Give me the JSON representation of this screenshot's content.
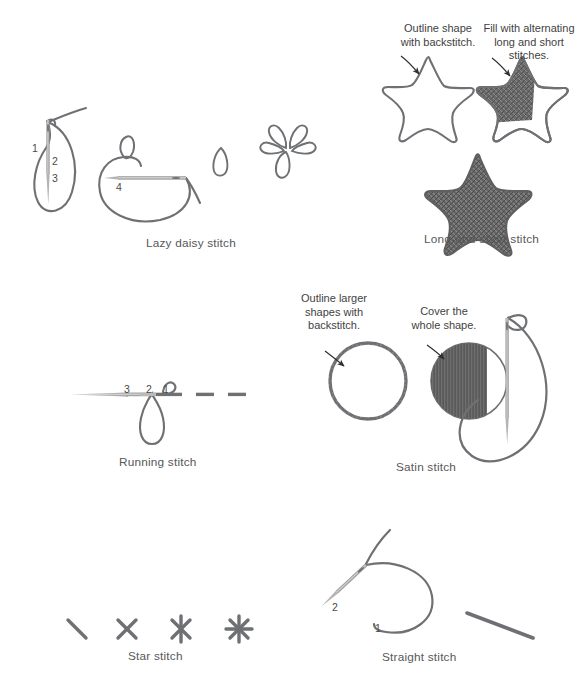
{
  "page": {
    "background_color": "#ffffff",
    "thread_color": "#6e7073",
    "fill_color": "#575757",
    "needle_color": "#9a9a9a",
    "text_color": "#4a4a4a"
  },
  "sections": [
    {
      "id": "lazy-daisy",
      "caption": "Lazy daisy stitch",
      "step_numbers": [
        "1",
        "2",
        "3",
        "4"
      ]
    },
    {
      "id": "long-and-short",
      "caption": "Long-and-short stitch",
      "annotations": [
        {
          "id": "outline-backstitch",
          "text": "Outline shape\nwith backstitch."
        },
        {
          "id": "fill-long-short",
          "text": "Fill with alternating\nlong and short\nstitches."
        }
      ]
    },
    {
      "id": "running",
      "caption": "Running stitch",
      "step_numbers": [
        "3",
        "2",
        "1"
      ]
    },
    {
      "id": "satin",
      "caption": "Satin stitch",
      "annotations": [
        {
          "id": "outline-larger-shapes",
          "text": "Outline larger\nshapes with\nbackstitch."
        },
        {
          "id": "cover-whole-shape",
          "text": "Cover the\nwhole shape."
        }
      ]
    },
    {
      "id": "star",
      "caption": "Star stitch"
    },
    {
      "id": "straight",
      "caption": "Straight stitch",
      "step_numbers": [
        "2",
        "1"
      ]
    }
  ],
  "captions": {
    "lazy_daisy": "Lazy daisy stitch",
    "long_and_short": "Long-and-short stitch",
    "running": "Running stitch",
    "satin": "Satin stitch",
    "star": "Star stitch",
    "straight": "Straight stitch"
  },
  "annotations": {
    "outline_shape_backstitch": "Outline shape\nwith backstitch.",
    "fill_alternating": "Fill with alternating\nlong and short\nstitches.",
    "outline_larger_shapes": "Outline larger\nshapes with\nbackstitch.",
    "cover_whole_shape": "Cover the\nwhole shape."
  },
  "numbers": {
    "ld1": "1",
    "ld2": "2",
    "ld3": "3",
    "ld4": "4",
    "rs3": "3",
    "rs2": "2",
    "rs1": "1",
    "ss2": "2",
    "ss1": "1"
  }
}
